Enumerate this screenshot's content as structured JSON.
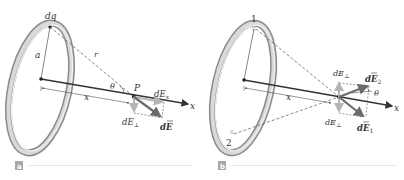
{
  "figure": {
    "panels": [
      {
        "id": "a",
        "tag": "a",
        "labels": {
          "charge_element": "dq",
          "radius": "a",
          "distance": "r",
          "angle": "θ",
          "point": "P",
          "axis_distance": "x",
          "axis": "x",
          "field_x": "dEx",
          "field_x_base": "dE",
          "field_x_sub": "x",
          "field_perp_base": "dE",
          "field_perp_sub": "⊥",
          "field_vector": "dE"
        }
      },
      {
        "id": "b",
        "tag": "b",
        "labels": {
          "point_1": "1",
          "point_2": "2",
          "axis_distance": "x",
          "axis": "x",
          "angle": "θ",
          "field_perp_top_base": "dE",
          "field_perp_top_sub": "⊥",
          "field_perp_bottom_base": "dE",
          "field_perp_bottom_sub": "⊥",
          "field_vector_2_base": "dE",
          "field_vector_2_sub": "2",
          "field_vector_1_base": "dE",
          "field_vector_1_sub": "1"
        }
      }
    ],
    "colors": {
      "ring_outer": "#8a8a8a",
      "ring_inner": "#d9d9d9",
      "ring_highlight": "#f2f2f2",
      "axis": "#333333",
      "field_vector": "#6b6b6b",
      "component_vector": "#b5b5b5",
      "tag_bg": "#a8a8a8",
      "rule": "#e6e6e6"
    }
  }
}
